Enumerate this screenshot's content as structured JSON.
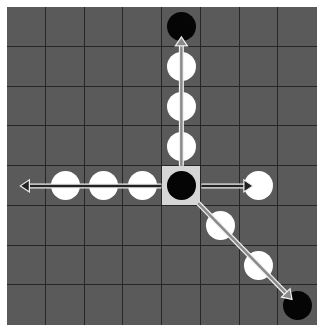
{
  "board": {
    "rows": 8,
    "cols": 8,
    "colors": {
      "board": "#5a5a5a",
      "grid_line": "#262626",
      "highlight": "#d6d6d6",
      "white_disc": "#ffffff",
      "black_disc": "#050505",
      "arrow_fill": "#8a8a8a",
      "arrow_outline": "#f0f0f0"
    },
    "highlighted_cell": {
      "row": 4,
      "col": 4
    },
    "discs": [
      {
        "row": 0,
        "col": 4,
        "color": "black"
      },
      {
        "row": 1,
        "col": 4,
        "color": "white"
      },
      {
        "row": 2,
        "col": 4,
        "color": "white"
      },
      {
        "row": 3,
        "col": 4,
        "color": "white"
      },
      {
        "row": 4,
        "col": 1,
        "color": "white"
      },
      {
        "row": 4,
        "col": 2,
        "color": "white"
      },
      {
        "row": 4,
        "col": 3,
        "color": "white"
      },
      {
        "row": 4,
        "col": 4,
        "color": "black"
      },
      {
        "row": 4,
        "col": 6,
        "color": "white"
      },
      {
        "row": 5,
        "col": 5,
        "color": "white"
      },
      {
        "row": 6,
        "col": 6,
        "color": "white"
      },
      {
        "row": 7,
        "col": 7,
        "color": "black"
      }
    ],
    "arrows": [
      {
        "direction": "up",
        "from": {
          "row": 4,
          "col": 4
        },
        "to": {
          "row": 0,
          "col": 4
        }
      },
      {
        "direction": "left",
        "from": {
          "row": 4,
          "col": 4
        },
        "to": {
          "row": 4,
          "col": 0
        }
      },
      {
        "direction": "right",
        "from": {
          "row": 4,
          "col": 4
        },
        "to": {
          "row": 4,
          "col": 6
        }
      },
      {
        "direction": "down-right",
        "from": {
          "row": 4,
          "col": 4
        },
        "to": {
          "row": 7,
          "col": 7
        }
      }
    ]
  }
}
